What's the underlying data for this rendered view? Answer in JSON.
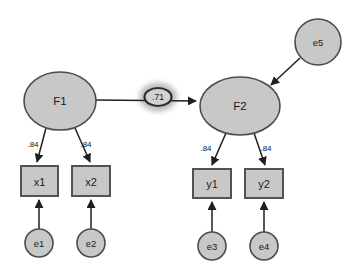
{
  "diagram": {
    "type": "structural-equation-model-path-diagram",
    "background_color": "#ffffff",
    "node_fill_color": "#c8c8c8",
    "node_stroke_color": "#4c4c4c",
    "path_color": "#1f1f1f",
    "latent_factors": [
      {
        "id": "F1",
        "label": "F1",
        "shape": "ellipse",
        "cx": 60,
        "cy": 101,
        "rx": 36,
        "ry": 29
      },
      {
        "id": "F2",
        "label": "F2",
        "shape": "ellipse",
        "cx": 240,
        "cy": 106,
        "rx": 40,
        "ry": 29
      }
    ],
    "observed_indicators": [
      {
        "id": "x1",
        "label": "x1",
        "shape": "rect",
        "x": 21,
        "y": 166,
        "w": 37,
        "h": 30
      },
      {
        "id": "x2",
        "label": "x2",
        "shape": "rect",
        "x": 72,
        "y": 166,
        "w": 38,
        "h": 30
      },
      {
        "id": "y1",
        "label": "y1",
        "shape": "rect",
        "x": 193,
        "y": 169,
        "w": 38,
        "h": 29
      },
      {
        "id": "y2",
        "label": "y2",
        "shape": "rect",
        "x": 245,
        "y": 169,
        "w": 38,
        "h": 29
      }
    ],
    "error_terms": [
      {
        "id": "e1",
        "label": "e1",
        "shape": "circle",
        "cx": 39,
        "cy": 243,
        "r": 14
      },
      {
        "id": "e2",
        "label": "e2",
        "shape": "circle",
        "cx": 91,
        "cy": 243,
        "r": 14
      },
      {
        "id": "e3",
        "label": "e3",
        "shape": "circle",
        "cx": 212,
        "cy": 246,
        "r": 14
      },
      {
        "id": "e4",
        "label": "e4",
        "shape": "circle",
        "cx": 264,
        "cy": 246,
        "r": 14
      },
      {
        "id": "e5",
        "label": "e5",
        "shape": "circle",
        "cx": 318,
        "cy": 42,
        "r": 23
      }
    ],
    "paths": [
      {
        "from": "F1",
        "to": "F2",
        "coefficient": ".71",
        "highlighted": true,
        "label_x": 158,
        "label_y": 97
      },
      {
        "from": "F1",
        "to": "x1",
        "coefficient": ".84",
        "label_x": 33,
        "label_y": 144
      },
      {
        "from": "F1",
        "to": "x2",
        "coefficient": ".84",
        "label_x": 86,
        "label_y": 144
      },
      {
        "from": "F2",
        "to": "y1",
        "coefficient": ".84",
        "label_x": 206,
        "label_y": 148
      },
      {
        "from": "F2",
        "to": "y2",
        "coefficient": ".84",
        "label_x": 266,
        "label_y": 148
      },
      {
        "from": "e1",
        "to": "x1",
        "coefficient": "",
        "label_x": 0,
        "label_y": 0
      },
      {
        "from": "e2",
        "to": "x2",
        "coefficient": "",
        "label_x": 0,
        "label_y": 0
      },
      {
        "from": "e3",
        "to": "y1",
        "coefficient": "",
        "label_x": 0,
        "label_y": 0
      },
      {
        "from": "e4",
        "to": "y2",
        "coefficient": "",
        "label_x": 0,
        "label_y": 0
      },
      {
        "from": "e5",
        "to": "F2",
        "coefficient": "",
        "label_x": 0,
        "label_y": 0
      }
    ]
  }
}
